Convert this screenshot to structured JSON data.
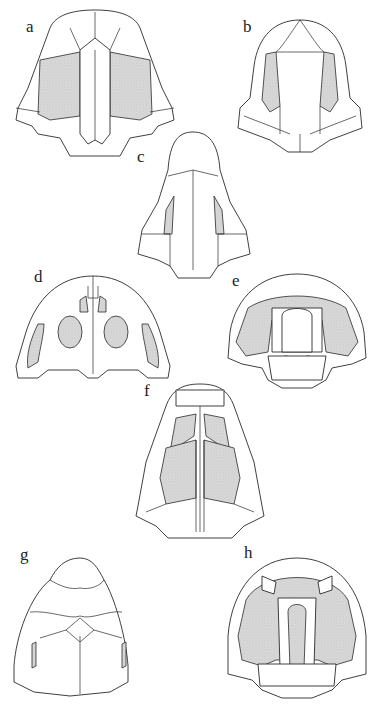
{
  "figure": {
    "type": "anatomical plate",
    "shading_color": "#d6d6d6",
    "line_color": "#2a2a2a",
    "background": "#ffffff"
  },
  "panels": [
    {
      "label": "a"
    },
    {
      "label": "b"
    },
    {
      "label": "c"
    },
    {
      "label": "d"
    },
    {
      "label": "e"
    },
    {
      "label": "f"
    },
    {
      "label": "g"
    },
    {
      "label": "h"
    }
  ]
}
